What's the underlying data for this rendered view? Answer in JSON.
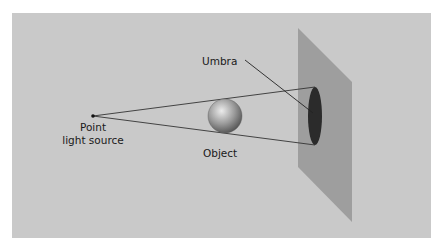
{
  "diagram": {
    "labels": {
      "umbra": "Umbra",
      "point_line1": "Point",
      "point_line2": "light source",
      "object": "Object"
    },
    "colors": {
      "background": "#c9c9c9",
      "screen": "#9e9e9e",
      "umbra": "#2b2b2b",
      "rays": "#333333",
      "sphere_light": "#e6e6e6",
      "sphere_dark": "#5a5a5a"
    },
    "geometry": {
      "light_source": [
        93,
        116
      ],
      "sphere": {
        "cx": 225,
        "cy": 116,
        "r": 17
      },
      "umbra_ellipse": {
        "cx": 315,
        "cy": 116,
        "rx": 7,
        "ry": 29
      },
      "screen_polygon": [
        [
          298,
          28
        ],
        [
          352,
          82
        ],
        [
          352,
          222
        ],
        [
          298,
          167
        ]
      ]
    }
  }
}
